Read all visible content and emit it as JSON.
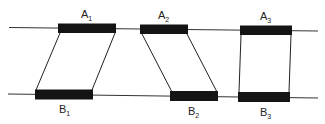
{
  "diagram": {
    "type": "pairing-diagram",
    "lines": {
      "top": {
        "name": "top-strand-line"
      },
      "bottom": {
        "name": "bottom-strand-line"
      }
    },
    "top_segments": [
      {
        "label": "A",
        "subscript": "1"
      },
      {
        "label": "A",
        "subscript": "2"
      },
      {
        "label": "A",
        "subscript": "3"
      }
    ],
    "bottom_segments": [
      {
        "label": "B",
        "subscript": "1"
      },
      {
        "label": "B",
        "subscript": "2"
      },
      {
        "label": "B",
        "subscript": "3"
      }
    ],
    "connections": [
      {
        "from": "A1",
        "to": "B1",
        "shape": "parallelogram-left-lean"
      },
      {
        "from": "A2",
        "to": "B2",
        "shape": "parallelogram-right-lean"
      },
      {
        "from": "A3",
        "to": "B3",
        "shape": "rectangle-aligned"
      }
    ],
    "colors": {
      "line": "#333333",
      "bar": "#141414",
      "background": "#ffffff"
    }
  }
}
